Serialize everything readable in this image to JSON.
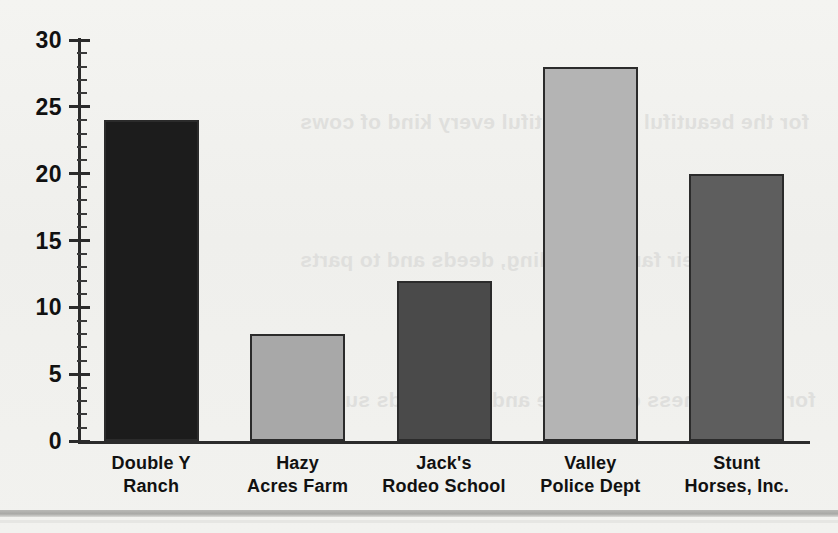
{
  "chart_data": {
    "type": "bar",
    "title": "",
    "xlabel": "",
    "ylabel": "",
    "categories": [
      "Double Y\nRanch",
      "Hazy\nAcres Farm",
      "Jack's\nRodeo School",
      "Valley\nPolice Dept",
      "Stunt\nHorses, Inc."
    ],
    "category_lines": [
      [
        "Double Y",
        "Ranch"
      ],
      [
        "Hazy",
        "Acres Farm"
      ],
      [
        "Jack's",
        "Rodeo School"
      ],
      [
        "Valley",
        "Police Dept"
      ],
      [
        "Stunt",
        "Horses, Inc."
      ]
    ],
    "values": [
      24,
      8,
      12,
      28,
      20
    ],
    "bar_colors": [
      "#1c1c1c",
      "#a8a8a8",
      "#4a4a4a",
      "#b4b4b4",
      "#5e5e5e"
    ],
    "ylim": [
      0,
      30
    ],
    "ytick_labels": [
      "0",
      "5",
      "10",
      "15",
      "20",
      "25",
      "30"
    ],
    "ytick_values": [
      0,
      5,
      10,
      15,
      20,
      25,
      30
    ],
    "minor_tick_step": 1,
    "grid": false,
    "legend": null
  },
  "page": {
    "background_ghost_text": [
      "for the beautiful and beautiful every kind of cows",
      "and their families, riding, deeds and to parts",
      "for the business of a horse and the worlds supply"
    ]
  }
}
